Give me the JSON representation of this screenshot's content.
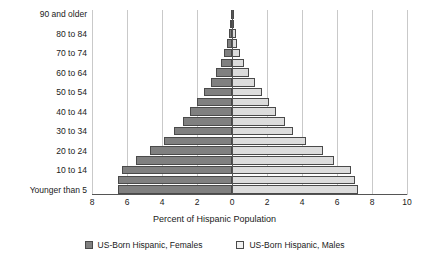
{
  "chart_data": {
    "type": "bar",
    "subtype": "population-pyramid",
    "title": "",
    "xlabel": "Percent of Hispanic Population",
    "ylabel": "",
    "grid": true,
    "legend_position": "bottom",
    "xlim": [
      -8,
      10
    ],
    "xticks": [
      -8,
      -6,
      -4,
      -2,
      0,
      2,
      4,
      6,
      8,
      10
    ],
    "xtick_labels": [
      "8",
      "6",
      "4",
      "2",
      "0",
      "2",
      "4",
      "6",
      "8",
      "10"
    ],
    "categories": [
      "Younger than 5",
      "5 to 9",
      "10 to 14",
      "15 to 19",
      "20 to 24",
      "25 to 29",
      "30 to 34",
      "35 to 39",
      "40 to 44",
      "45 to 49",
      "50 to 54",
      "55 to 59",
      "60 to 64",
      "65 to 69",
      "70 to 74",
      "75 to 79",
      "80 to 84",
      "85 to 89",
      "90 and older"
    ],
    "ytick_labels": [
      "Younger than 5",
      "",
      "10 to 14",
      "",
      "20 to 24",
      "",
      "30 to 34",
      "",
      "40 to 44",
      "",
      "50 to 54",
      "",
      "60 to 64",
      "",
      "70 to 74",
      "",
      "80 to 84",
      "",
      "90 and older"
    ],
    "series": [
      {
        "name": "US-Born Hispanic, Females",
        "color": "#808080",
        "direction": "left",
        "values": [
          6.5,
          6.5,
          6.3,
          5.5,
          4.7,
          3.9,
          3.3,
          2.8,
          2.4,
          2.0,
          1.6,
          1.2,
          0.9,
          0.65,
          0.45,
          0.3,
          0.2,
          0.12,
          0.08
        ]
      },
      {
        "name": "US-Born Hispanic, Males",
        "color": "#dcdcdc",
        "direction": "right",
        "values": [
          7.2,
          7.0,
          6.8,
          5.8,
          5.2,
          4.2,
          3.5,
          3.0,
          2.5,
          2.1,
          1.7,
          1.3,
          0.95,
          0.7,
          0.45,
          0.3,
          0.2,
          0.1,
          0.06
        ]
      }
    ]
  },
  "legend": {
    "items": [
      {
        "label": "US-Born Hispanic, Females"
      },
      {
        "label": "US-Born Hispanic, Males"
      }
    ]
  }
}
